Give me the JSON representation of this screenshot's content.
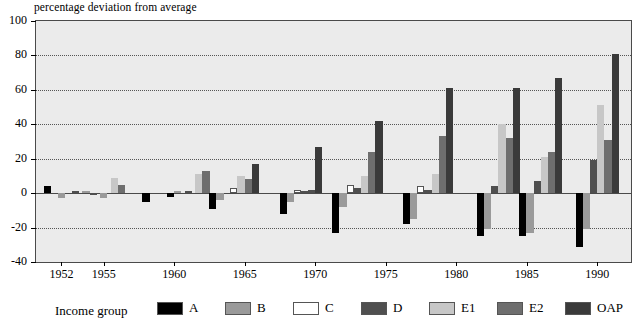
{
  "chart_data": {
    "type": "bar",
    "title": "",
    "subtitle": "",
    "ylabel": "percentage deviation from average",
    "xlabel": "",
    "ylim": [
      -40,
      100
    ],
    "ytick_values": [
      -40,
      -20,
      0,
      20,
      40,
      60,
      80,
      100
    ],
    "ytick_labels": [
      "-40",
      "-20",
      "0",
      "20",
      "40",
      "60",
      "80",
      "100"
    ],
    "grid": "horizontal-dotted",
    "legend_position": "bottom",
    "legend_title": "Income group",
    "x": [
      1951,
      1952,
      1953,
      1954,
      1955,
      1956,
      1957,
      1958,
      1959,
      1960,
      1961,
      1963,
      1964,
      1965,
      1966,
      1968,
      1969,
      1970,
      1971,
      1973,
      1975,
      1976,
      1978,
      1980,
      1981,
      1983,
      1985,
      1986,
      1988,
      1990,
      1991
    ],
    "xtick_labels": [
      "1952",
      "1955",
      "1960",
      "1965",
      "1970",
      "1975",
      "1980",
      "1985",
      "1990"
    ],
    "xtick_values": [
      1952,
      1955,
      1960,
      1965,
      1970,
      1975,
      1980,
      1985,
      1990
    ],
    "series": [
      {
        "name": "A",
        "color": "#000000",
        "values": [
          4,
          null,
          null,
          null,
          null,
          null,
          null,
          -5,
          null,
          -3,
          null,
          -9,
          null,
          null,
          null,
          -12,
          null,
          null,
          null,
          -23,
          null,
          null,
          -18,
          null,
          null,
          -25,
          null,
          null,
          -30,
          null,
          null
        ]
      },
      {
        "name": "B",
        "color": "#9a9a9a",
        "values": [
          null,
          -3,
          null,
          1,
          null,
          null,
          null,
          null,
          null,
          null,
          -1,
          null,
          null,
          null,
          null,
          null,
          -1,
          null,
          null,
          -5,
          null,
          null,
          -5,
          null,
          -13,
          null,
          -21,
          null,
          -21,
          -2,
          null
        ]
      },
      {
        "name": "C",
        "color": "#ffffff",
        "values": [
          null,
          null,
          null,
          null,
          null,
          null,
          null,
          null,
          null,
          null,
          null,
          null,
          null,
          null,
          null,
          null,
          null,
          null,
          null,
          5,
          null,
          null,
          3,
          null,
          7,
          null,
          null,
          null,
          null,
          null,
          null
        ]
      },
      {
        "name": "D",
        "color": "#4f4f4f",
        "values": [
          null,
          null,
          1,
          null,
          1,
          null,
          null,
          null,
          null,
          null,
          null,
          null,
          9,
          null,
          null,
          null,
          null,
          2,
          null,
          3,
          null,
          null,
          2,
          null,
          4,
          null,
          7,
          null,
          null,
          19,
          null
        ]
      },
      {
        "name": "E1",
        "color": "#c7c7c7",
        "values": [
          null,
          null,
          null,
          null,
          null,
          9,
          null,
          null,
          null,
          null,
          null,
          null,
          null,
          11,
          null,
          null,
          null,
          null,
          null,
          10,
          null,
          null,
          null,
          40,
          null,
          null,
          21,
          null,
          null,
          51,
          null
        ]
      },
      {
        "name": "E2",
        "color": "#6e6e6e",
        "values": [
          null,
          null,
          null,
          null,
          null,
          null,
          5,
          null,
          null,
          null,
          null,
          null,
          null,
          null,
          17,
          null,
          null,
          null,
          null,
          24,
          null,
          null,
          null,
          33,
          null,
          null,
          24,
          null,
          null,
          31,
          null
        ]
      },
      {
        "name": "OAP",
        "color": "#3a3a3a",
        "values": [
          null,
          null,
          null,
          null,
          null,
          null,
          null,
          null,
          null,
          null,
          null,
          null,
          null,
          null,
          null,
          null,
          null,
          27,
          null,
          42,
          null,
          null,
          null,
          61,
          null,
          null,
          67,
          null,
          null,
          81,
          null
        ]
      }
    ],
    "groups": [
      {
        "year": 1951,
        "bars": [
          {
            "s": "A",
            "v": 4
          }
        ]
      },
      {
        "year": 1952,
        "bars": [
          {
            "s": "B",
            "v": -3
          }
        ]
      },
      {
        "year": 1953,
        "bars": [
          {
            "s": "D",
            "v": 1
          }
        ]
      },
      {
        "year": 1954,
        "bars": [
          {
            "s": "B",
            "v": 1
          },
          {
            "s": "D",
            "v": -1
          }
        ]
      },
      {
        "year": 1955,
        "bars": [
          {
            "s": "B",
            "v": -3
          }
        ]
      },
      {
        "year": 1956,
        "bars": [
          {
            "s": "E1",
            "v": 9
          },
          {
            "s": "E2",
            "v": 5
          }
        ]
      },
      {
        "year": 1958,
        "bars": [
          {
            "s": "A",
            "v": -5
          }
        ]
      },
      {
        "year": 1960,
        "bars": [
          {
            "s": "A",
            "v": -2
          },
          {
            "s": "B",
            "v": 1
          }
        ]
      },
      {
        "year": 1961,
        "bars": [
          {
            "s": "D",
            "v": 1
          }
        ]
      },
      {
        "year": 1962,
        "bars": [
          {
            "s": "E1",
            "v": 11
          },
          {
            "s": "E2",
            "v": 13
          }
        ]
      },
      {
        "year": 1963,
        "bars": [
          {
            "s": "A",
            "v": -9
          },
          {
            "s": "B",
            "v": -4
          }
        ]
      },
      {
        "year": 1965,
        "bars": [
          {
            "s": "C",
            "v": 3
          },
          {
            "s": "E1",
            "v": 10
          },
          {
            "s": "E2",
            "v": 8
          },
          {
            "s": "OAP",
            "v": 17
          }
        ]
      },
      {
        "year": 1968,
        "bars": [
          {
            "s": "A",
            "v": -12
          },
          {
            "s": "B",
            "v": -5
          }
        ]
      },
      {
        "year": 1969,
        "bars": [
          {
            "s": "C",
            "v": 2
          },
          {
            "s": "D",
            "v": 1
          }
        ]
      },
      {
        "year": 1970,
        "bars": [
          {
            "s": "D",
            "v": 2
          },
          {
            "s": "OAP",
            "v": 27
          }
        ]
      },
      {
        "year": 1973,
        "bars": [
          {
            "s": "A",
            "v": -23
          },
          {
            "s": "B",
            "v": -8
          },
          {
            "s": "C",
            "v": 5
          },
          {
            "s": "D",
            "v": 3
          },
          {
            "s": "E1",
            "v": 10
          },
          {
            "s": "E2",
            "v": 24
          },
          {
            "s": "OAP",
            "v": 42
          }
        ]
      },
      {
        "year": 1978,
        "bars": [
          {
            "s": "A",
            "v": -18
          },
          {
            "s": "B",
            "v": -15
          },
          {
            "s": "C",
            "v": 4
          },
          {
            "s": "D",
            "v": 2
          },
          {
            "s": "E1",
            "v": 11
          },
          {
            "s": "E2",
            "v": 33
          },
          {
            "s": "OAP",
            "v": 61
          }
        ]
      },
      {
        "year": 1983,
        "bars": [
          {
            "s": "A",
            "v": -25
          },
          {
            "s": "B",
            "v": -21
          },
          {
            "s": "D",
            "v": 4
          },
          {
            "s": "E1",
            "v": 40
          },
          {
            "s": "E2",
            "v": 32
          },
          {
            "s": "OAP",
            "v": 61
          }
        ]
      },
      {
        "year": 1986,
        "bars": [
          {
            "s": "A",
            "v": -25
          },
          {
            "s": "B",
            "v": -23
          },
          {
            "s": "D",
            "v": 7
          },
          {
            "s": "E1",
            "v": 21
          },
          {
            "s": "E2",
            "v": 24
          },
          {
            "s": "OAP",
            "v": 67
          }
        ]
      },
      {
        "year": 1990,
        "bars": [
          {
            "s": "A",
            "v": -31
          },
          {
            "s": "B",
            "v": -21
          },
          {
            "s": "D",
            "v": 19
          },
          {
            "s": "E1",
            "v": 51
          },
          {
            "s": "E2",
            "v": 31
          },
          {
            "s": "OAP",
            "v": 81
          }
        ]
      }
    ]
  },
  "legend": {
    "title": "Income group",
    "items": [
      {
        "label": "A",
        "color": "#000000"
      },
      {
        "label": "B",
        "color": "#9a9a9a"
      },
      {
        "label": "C",
        "color": "#ffffff"
      },
      {
        "label": "D",
        "color": "#4f4f4f"
      },
      {
        "label": "E1",
        "color": "#c7c7c7"
      },
      {
        "label": "E2",
        "color": "#6e6e6e"
      },
      {
        "label": "OAP",
        "color": "#3a3a3a"
      }
    ]
  },
  "axis": {
    "caption": "percentage deviation from average"
  },
  "colors": {
    "plot_background": "#ebebeb",
    "frame": "#4a4a4a",
    "grid": "#555555",
    "page_background": "#ffffff"
  }
}
